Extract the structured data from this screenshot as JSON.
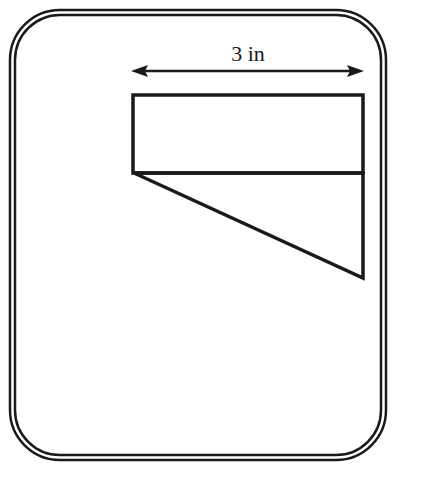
{
  "figure": {
    "background_color": "#ffffff",
    "stroke_color": "#1a1a1a",
    "border": {
      "name": "rounded-double-border",
      "outer": {
        "x": 10,
        "y": 10,
        "width": 376,
        "height": 450,
        "radius": 50
      },
      "inner": {
        "x": 15,
        "y": 15,
        "width": 366,
        "height": 440,
        "radius": 45
      },
      "stroke_width": 2.5
    },
    "dimension": {
      "label": "3 in",
      "label_x": 248,
      "label_y": 61,
      "line_y": 71,
      "x_start": 132,
      "x_end": 363,
      "arrow_both_ends": true,
      "stroke_width": 2.5
    },
    "rectangle": {
      "name": "top-rectangle",
      "x": 133,
      "y": 95,
      "width": 230,
      "height": 78,
      "stroke_width": 3.5
    },
    "triangle": {
      "name": "lower-right-triangle",
      "points": "134,173 363,173 363,278",
      "apex_left": [
        134,
        173
      ],
      "right_angle_vertex": [
        363,
        173
      ],
      "bottom_vertex": [
        363,
        278
      ],
      "stroke_width": 3.5
    }
  },
  "chart_data": {
    "type": "diagram",
    "title": "3 in",
    "annotations": [
      {
        "text": "3 in",
        "kind": "dimension-label",
        "value": 3,
        "unit": "in"
      }
    ],
    "shapes": [
      {
        "kind": "rectangle",
        "width_in": 3,
        "position": "top"
      },
      {
        "kind": "right-triangle",
        "base_in": 3,
        "position": "below-rectangle"
      }
    ]
  }
}
